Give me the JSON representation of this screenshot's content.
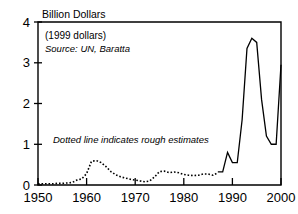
{
  "chart_data": {
    "type": "line",
    "title": "Billion Dollars",
    "subtitle": "(1999 dollars)",
    "source": "Source: UN, Baratta",
    "annotation": "Dotted line indicates rough estimates",
    "xlabel": "",
    "ylabel": "Billion Dollars",
    "xlim": [
      1950,
      2000
    ],
    "ylim": [
      0,
      4
    ],
    "xticks": [
      1950,
      1960,
      1970,
      1980,
      1990,
      2000
    ],
    "xtick_labels": [
      "1950",
      "1960",
      "1970",
      "1980",
      "1990",
      "2000"
    ],
    "yticks": [
      0,
      1,
      2,
      3,
      4
    ],
    "ytick_labels": [
      "0",
      "1",
      "2",
      "3",
      "4"
    ],
    "grid": false,
    "legend": null,
    "series": [
      {
        "name": "Rough estimates",
        "style": "dotted",
        "x": [
          1950,
          1951,
          1952,
          1953,
          1954,
          1955,
          1956,
          1957,
          1958,
          1959,
          1960,
          1961,
          1962,
          1963,
          1964,
          1965,
          1966,
          1967,
          1968,
          1969,
          1970,
          1971,
          1972,
          1973,
          1974,
          1975,
          1976,
          1977,
          1978,
          1979,
          1980,
          1981,
          1982,
          1983,
          1984,
          1985,
          1986,
          1987
        ],
        "values": [
          0.03,
          0.03,
          0.03,
          0.03,
          0.04,
          0.04,
          0.05,
          0.06,
          0.12,
          0.15,
          0.28,
          0.58,
          0.6,
          0.55,
          0.45,
          0.33,
          0.25,
          0.2,
          0.17,
          0.14,
          0.12,
          0.1,
          0.08,
          0.1,
          0.2,
          0.33,
          0.34,
          0.3,
          0.32,
          0.3,
          0.26,
          0.24,
          0.23,
          0.24,
          0.27,
          0.27,
          0.24,
          0.3
        ]
      },
      {
        "name": "Reported",
        "style": "solid",
        "x": [
          1987,
          1988,
          1989,
          1990,
          1991,
          1992,
          1993,
          1994,
          1995,
          1996,
          1997,
          1998,
          1999,
          2000
        ],
        "values": [
          0.32,
          0.32,
          0.8,
          0.55,
          0.55,
          1.6,
          3.35,
          3.6,
          3.5,
          2.1,
          1.2,
          1.0,
          1.0,
          2.95
        ]
      }
    ]
  }
}
